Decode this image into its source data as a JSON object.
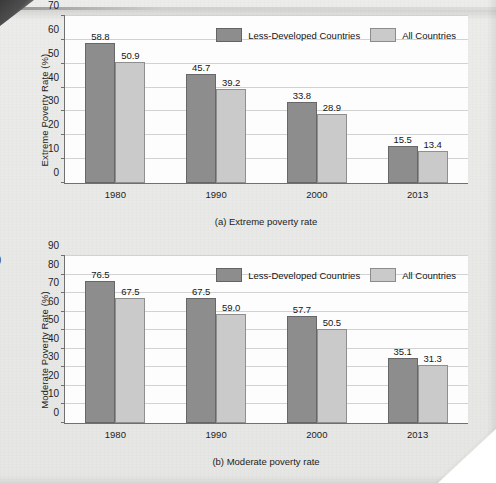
{
  "legend": {
    "series": [
      {
        "label": "Less-Developed Countries",
        "color": "#8d8d8d",
        "icon": "legend-swatch-dark"
      },
      {
        "label": "All Countries",
        "color": "#cacaca",
        "icon": "legend-swatch-light"
      }
    ]
  },
  "figure_b_marker": ")",
  "chart_data": [
    {
      "id": "a",
      "type": "bar",
      "title": "",
      "caption": "(a) Extreme poverty rate",
      "xlabel": "",
      "ylabel": "Extreme Poverty Rate (%)",
      "categories": [
        "1980",
        "1990",
        "2000",
        "2013"
      ],
      "ylim": [
        0,
        70
      ],
      "yticks": [
        0,
        10,
        20,
        30,
        40,
        50,
        60,
        70
      ],
      "grid": true,
      "legend_position": "top-right",
      "series": [
        {
          "name": "Less-Developed Countries",
          "color": "#8d8d8d",
          "values": [
            58.8,
            45.7,
            33.8,
            15.5
          ],
          "labels": [
            "58.8",
            "45.7",
            "33.8",
            "15.5"
          ]
        },
        {
          "name": "All Countries",
          "color": "#cacaca",
          "values": [
            50.9,
            39.2,
            28.9,
            13.4
          ],
          "labels": [
            "50.9",
            "39.2",
            "28.9",
            "13.4"
          ]
        }
      ]
    },
    {
      "id": "b",
      "type": "bar",
      "title": "",
      "caption": "(b) Moderate poverty rate",
      "xlabel": "",
      "ylabel": "Moderate Poverty Rate (%)",
      "categories": [
        "1980",
        "1990",
        "2000",
        "2013"
      ],
      "ylim": [
        0,
        90
      ],
      "yticks": [
        0,
        10,
        20,
        30,
        40,
        50,
        60,
        70,
        80,
        90
      ],
      "grid": true,
      "legend_position": "top-right",
      "series": [
        {
          "name": "Less-Developed Countries",
          "color": "#8d8d8d",
          "values": [
            76.5,
            67.5,
            57.7,
            35.1
          ],
          "labels": [
            "76.5",
            "67.5",
            "57.7",
            "35.1"
          ]
        },
        {
          "name": "All Countries",
          "color": "#cacaca",
          "values": [
            67.5,
            59.0,
            50.5,
            31.3
          ],
          "labels": [
            "67.5",
            "59.0",
            "50.5",
            "31.3"
          ]
        }
      ]
    }
  ]
}
